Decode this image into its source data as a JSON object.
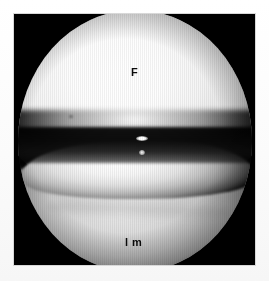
{
  "image": {
    "kind": "arthroscopy-photograph",
    "modality": "knee-arthroscopy",
    "frame": {
      "background_color": "#000000",
      "margin_color": "#ffffff"
    },
    "scope_field": {
      "shape": "circle",
      "border_color": "#000000"
    }
  },
  "annotations": [
    {
      "id": "femur",
      "label": "F",
      "meaning": "femoral condyle",
      "color": "#0a0a0a"
    },
    {
      "id": "meniscus",
      "label": "l m",
      "meaning": "lateral meniscus",
      "color": "#0a0a0a"
    }
  ],
  "structures": {
    "femoral_condyle": {
      "name": "femoral-condyle",
      "tone": "bright-white-dome",
      "highlight_color": "#ffffff"
    },
    "joint_space": {
      "name": "joint-space",
      "tone": "dark-band",
      "shadow_color": "#000000"
    },
    "meniscus_wedge": {
      "name": "meniscus-wedge",
      "tone": "bright-wedge",
      "highlight_color": "#f6f6f6"
    },
    "tibial_plateau": {
      "name": "tibial-plateau",
      "tone": "mid-grey-mass",
      "base_color": "#cacaca"
    },
    "specular_highlight": {
      "name": "specular-highlight",
      "tone": "blown-out-white",
      "color": "#ffffff"
    }
  }
}
